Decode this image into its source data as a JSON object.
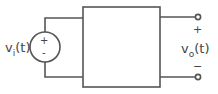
{
  "diagram": {
    "type": "two-port circuit block",
    "input_source": {
      "label": "v",
      "subscript": "i",
      "arg": "(t)",
      "plus": "+",
      "minus": "-"
    },
    "output": {
      "label": "v",
      "subscript": "o",
      "arg": "(t)",
      "plus": "+",
      "minus": "−"
    },
    "colors": {
      "stroke": "#555555",
      "text": "#444444",
      "background": "#ffffff"
    }
  }
}
